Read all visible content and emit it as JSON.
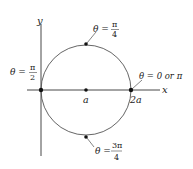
{
  "diagram": {
    "type": "polar-circle",
    "axes": {
      "x_label": "x",
      "y_label": "y"
    },
    "center_label": "a",
    "right_label": "2a",
    "points": [
      {
        "id": "top",
        "theta_prefix": "θ =",
        "num": "π",
        "den": "4"
      },
      {
        "id": "left",
        "theta_prefix": "θ =",
        "num": "π",
        "den": "2"
      },
      {
        "id": "right",
        "theta_text": "θ = 0 or π"
      },
      {
        "id": "bottom",
        "theta_prefix": "θ =",
        "num": "3π",
        "den": "4"
      }
    ],
    "colors": {
      "curve": "#555555",
      "axis": "#333333",
      "point": "#111111"
    }
  }
}
